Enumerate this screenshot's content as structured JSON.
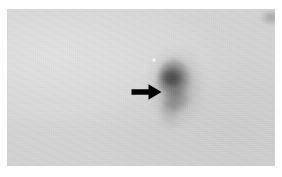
{
  "figure": {
    "domain_kind": "micrograph",
    "caption": "",
    "title": "",
    "plate": {
      "background_color": "#d4d4d4",
      "page_color": "#ffffff",
      "left": 7,
      "top": 9,
      "width": 268,
      "height": 157
    },
    "annotations": [
      {
        "id": "arrow-marker",
        "icon": "arrow-right-icon",
        "label": "",
        "color": "#000000",
        "points_to": "dark-spot",
        "x": 118,
        "y": 70,
        "width": 40,
        "height": 26
      }
    ],
    "features": [
      {
        "id": "dark-spot",
        "name": "stained-spot",
        "label": "",
        "description": "diffuse dark rounded mass with downward tail",
        "color": "#3c3c3c",
        "center_x": 167,
        "center_y": 74
      },
      {
        "id": "bright-speck",
        "name": "bright-speck",
        "label": "",
        "color": "#fbfbfb",
        "center_x": 147,
        "center_y": 51
      },
      {
        "id": "corner-smudge",
        "name": "corner-artifact",
        "label": "",
        "color": "#505050",
        "center_x": 264,
        "center_y": 17
      }
    ]
  }
}
